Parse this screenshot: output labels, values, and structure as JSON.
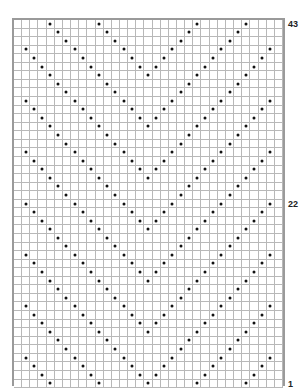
{
  "chart": {
    "type": "knitting-chart",
    "columns": 33,
    "rows": 43,
    "symbol": "dot",
    "colors": {
      "grid_line": "#b8b8b8",
      "border": "#9a9a9a",
      "dot": "#111111"
    },
    "row_labels": [
      {
        "text": "43",
        "row_from_top": 0
      },
      {
        "text": "22",
        "row_from_top": 21
      },
      {
        "text": "1",
        "row_from_top": 42
      }
    ],
    "dot_rows_top_to_bottom": [
      [
        4,
        10,
        22,
        28
      ],
      [
        5,
        11,
        21,
        27
      ],
      [
        6,
        12,
        20,
        26
      ],
      [
        1,
        7,
        13,
        19,
        25,
        31
      ],
      [
        2,
        8,
        14,
        18,
        24,
        30
      ],
      [
        3,
        9,
        15,
        17,
        23,
        29
      ],
      [
        4,
        10,
        16,
        22,
        28
      ],
      [
        5,
        11,
        21,
        27
      ],
      [
        6,
        12,
        20,
        26
      ],
      [
        1,
        7,
        13,
        19,
        25,
        31
      ],
      [
        2,
        8,
        14,
        18,
        24,
        30
      ],
      [
        3,
        9,
        15,
        17,
        23,
        29
      ],
      [
        4,
        10,
        16,
        22,
        28
      ],
      [
        5,
        11,
        21,
        27
      ],
      [
        6,
        12,
        20,
        26
      ],
      [
        1,
        7,
        13,
        19,
        25,
        31
      ],
      [
        2,
        8,
        14,
        18,
        24,
        30
      ],
      [
        3,
        9,
        15,
        17,
        23,
        29
      ],
      [
        4,
        10,
        16,
        22,
        28
      ],
      [
        5,
        11,
        21,
        27
      ],
      [
        6,
        12,
        20,
        26
      ],
      [
        1,
        7,
        13,
        19,
        25,
        31
      ],
      [
        2,
        8,
        14,
        18,
        24,
        30
      ],
      [
        3,
        9,
        15,
        17,
        23,
        29
      ],
      [
        4,
        10,
        16,
        22,
        28
      ],
      [
        5,
        11,
        21,
        27
      ],
      [
        6,
        12,
        20,
        26
      ],
      [
        1,
        7,
        13,
        19,
        25,
        31
      ],
      [
        2,
        8,
        14,
        18,
        24,
        30
      ],
      [
        3,
        9,
        15,
        17,
        23,
        29
      ],
      [
        4,
        10,
        16,
        22,
        28
      ],
      [
        5,
        11,
        21,
        27
      ],
      [
        6,
        12,
        20,
        26
      ],
      [
        1,
        7,
        13,
        19,
        25,
        31
      ],
      [
        2,
        8,
        14,
        18,
        24,
        30
      ],
      [
        3,
        9,
        15,
        17,
        23,
        29
      ],
      [
        4,
        10,
        16,
        22,
        28
      ],
      [
        5,
        11,
        21,
        27
      ],
      [
        6,
        12,
        20,
        26
      ],
      [
        1,
        7,
        13,
        19,
        25,
        31
      ],
      [
        2,
        8,
        14,
        18,
        24,
        30
      ],
      [
        3,
        9,
        15,
        17,
        23,
        29
      ],
      [
        4,
        10,
        16,
        22,
        28
      ]
    ]
  }
}
